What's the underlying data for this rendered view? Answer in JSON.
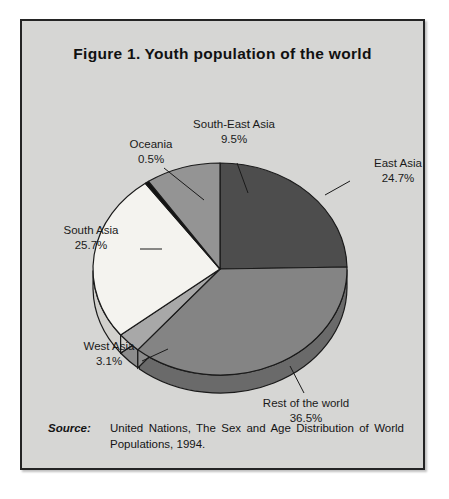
{
  "figure": {
    "number": "Figure 1.",
    "title": "Youth population of the world"
  },
  "source": {
    "label": "Source:",
    "text": "United Nations, The Sex and Age Distribution of World Populations, 1994."
  },
  "labels": {
    "east_asia": {
      "name": "East Asia",
      "value": "24.7%"
    },
    "rest_of_world": {
      "name": "Rest of the world",
      "value": "36.5%"
    },
    "west_asia": {
      "name": "West Asia",
      "value": "3.1%"
    },
    "south_asia": {
      "name": "South Asia",
      "value": "25.7%"
    },
    "oceania": {
      "name": "Oceania",
      "value": "0.5%"
    },
    "south_east_asia": {
      "name": "South-East Asia",
      "value": "9.5%"
    }
  },
  "chart_data": {
    "type": "pie",
    "unit": "percent",
    "three_d": true,
    "start_angle_deg": 0,
    "direction": "clockwise",
    "categories": [
      "East Asia",
      "Rest of the world",
      "West Asia",
      "South Asia",
      "Oceania",
      "South-East Asia"
    ],
    "values": [
      24.7,
      36.5,
      3.1,
      25.7,
      0.5,
      9.5
    ],
    "colors": [
      "#4d4d4d",
      "#848484",
      "#a8a8a8",
      "#f4f3ef",
      "#121212",
      "#949494"
    ],
    "side_colors": [
      "#343434",
      "#6a6a6a",
      "#8c8c8c",
      "#d2d1cd",
      "#0a0a0a",
      "#7a7a7a"
    ],
    "labels": [
      "East Asia 24.7%",
      "Rest of the world 36.5%",
      "West Asia 3.1%",
      "South Asia 25.7%",
      "Oceania 0.5%",
      "South-East Asia 9.5%"
    ],
    "legend": "none",
    "grid": false
  }
}
